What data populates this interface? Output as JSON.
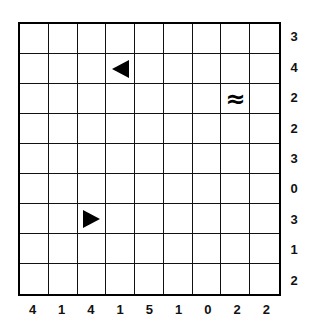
{
  "puzzle": {
    "type": "battleships",
    "rows": 9,
    "cols": 9,
    "row_clues": [
      "3",
      "4",
      "2",
      "2",
      "3",
      "0",
      "3",
      "1",
      "2"
    ],
    "col_clues": [
      "4",
      "1",
      "4",
      "1",
      "5",
      "1",
      "0",
      "2",
      "2"
    ],
    "given_cells": [
      {
        "row": 1,
        "col": 3,
        "symbol": "ship-end-left",
        "icon": "triangle-left-icon"
      },
      {
        "row": 2,
        "col": 7,
        "symbol": "≈",
        "icon": "water-icon"
      },
      {
        "row": 6,
        "col": 2,
        "symbol": "ship-end-right",
        "icon": "triangle-right-icon"
      }
    ],
    "colors": {
      "grid_line": "#000000",
      "background": "#ffffff",
      "clue_text": "#111111"
    }
  }
}
